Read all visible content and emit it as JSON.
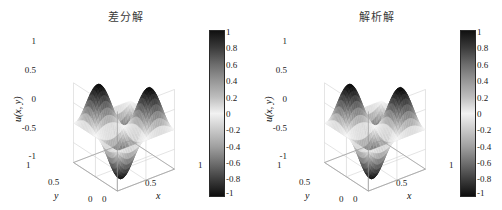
{
  "figure": {
    "background": "#ffffff",
    "panels": [
      {
        "id": "panel-left",
        "title": "差分解",
        "zlabel": "u(x, y)",
        "xlabel": "x",
        "ylabel": "y"
      },
      {
        "id": "panel-right",
        "title": "解析解",
        "zlabel": "u(x, y)",
        "xlabel": "x",
        "ylabel": "y"
      }
    ]
  },
  "chart_data": [
    {
      "type": "surface",
      "title": "差分解",
      "xlabel": "x",
      "ylabel": "y",
      "zlabel": "u(x, y)",
      "xlim": [
        0,
        1
      ],
      "ylim": [
        0,
        1
      ],
      "zlim": [
        -1,
        1
      ],
      "xticks": [
        0,
        0.5,
        1
      ],
      "xticklabels": [
        "0",
        "0.5",
        "1"
      ],
      "yticks": [
        0,
        0.5,
        1
      ],
      "yticklabels": [
        "0",
        "0.5",
        "1"
      ],
      "zticks": [
        -1,
        -0.5,
        0,
        0.5,
        1
      ],
      "zticklabels": [
        "-1",
        "-0.5",
        "0",
        "0.5",
        "1"
      ],
      "colormap": "gray-symmetric",
      "grid": true,
      "function": "sin(2*pi*x)*sin(2*pi*y)",
      "periods_x": 2,
      "periods_y": 2,
      "colorbar": {
        "position": "right",
        "min": -1,
        "max": 1,
        "ticks": [
          1,
          0.8,
          0.6,
          0.4,
          0.2,
          0,
          -0.2,
          -0.4,
          -0.6,
          -0.8,
          -1
        ],
        "ticklabels": [
          "1",
          "0.8",
          "0.6",
          "0.4",
          "0.2",
          "0",
          "-0.2",
          "-0.4",
          "-0.6",
          "-0.8",
          "-1"
        ]
      }
    },
    {
      "type": "surface",
      "title": "解析解",
      "xlabel": "x",
      "ylabel": "y",
      "zlabel": "u(x, y)",
      "xlim": [
        0,
        1
      ],
      "ylim": [
        0,
        1
      ],
      "zlim": [
        -1,
        1
      ],
      "xticks": [
        0,
        0.5,
        1
      ],
      "xticklabels": [
        "0",
        "0.5",
        "1"
      ],
      "yticks": [
        0,
        0.5,
        1
      ],
      "yticklabels": [
        "0",
        "0.5",
        "1"
      ],
      "zticks": [
        -1,
        -0.5,
        0,
        0.5,
        1
      ],
      "zticklabels": [
        "-1",
        "-0.5",
        "0",
        "0.5",
        "1"
      ],
      "colormap": "gray-symmetric",
      "grid": true,
      "function": "sin(2*pi*x)*sin(2*pi*y)",
      "periods_x": 2,
      "periods_y": 2,
      "colorbar": {
        "position": "right",
        "min": -1,
        "max": 1,
        "ticks": [
          1,
          0.8,
          0.6,
          0.4,
          0.2,
          0,
          -0.2,
          -0.4,
          -0.6,
          -0.8,
          -1
        ],
        "ticklabels": [
          "1",
          "0.8",
          "0.6",
          "0.4",
          "0.2",
          "0",
          "-0.2",
          "-0.4",
          "-0.6",
          "-0.8",
          "-1"
        ]
      }
    }
  ]
}
